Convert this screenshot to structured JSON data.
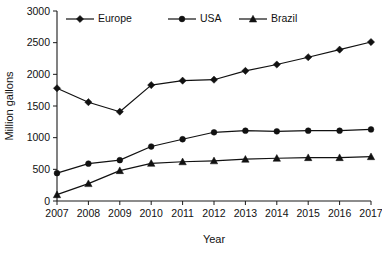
{
  "chart_data": {
    "type": "line",
    "title": "",
    "xlabel": "Year",
    "ylabel": "Million gallons",
    "categories": [
      "2007",
      "2008",
      "2009",
      "2010",
      "2011",
      "2012",
      "2013",
      "2014",
      "2015",
      "2016",
      "2017"
    ],
    "x": [
      2007,
      2008,
      2009,
      2010,
      2011,
      2012,
      2013,
      2014,
      2015,
      2016,
      2017
    ],
    "series": [
      {
        "name": "Europe",
        "marker": "diamond",
        "color": "#111111",
        "values": [
          1780,
          1560,
          1410,
          1830,
          1900,
          1915,
          2055,
          2155,
          2270,
          2390,
          2510
        ]
      },
      {
        "name": "USA",
        "marker": "circle",
        "color": "#111111",
        "values": [
          440,
          590,
          645,
          860,
          975,
          1085,
          1110,
          1100,
          1110,
          1110,
          1130
        ]
      },
      {
        "name": "Brazil",
        "marker": "triangle",
        "color": "#111111",
        "values": [
          100,
          275,
          480,
          595,
          620,
          635,
          660,
          675,
          685,
          685,
          700
        ]
      }
    ],
    "ylim": [
      0,
      3000
    ],
    "yticks": [
      0,
      500,
      1000,
      1500,
      2000,
      2500,
      3000
    ],
    "ytick_labels": [
      "0",
      "500",
      "1000",
      "1500",
      "2000",
      "2500",
      "3000"
    ],
    "grid": false,
    "legend_position": "top-inside",
    "legend": [
      "Europe",
      "USA",
      "Brazil"
    ]
  }
}
